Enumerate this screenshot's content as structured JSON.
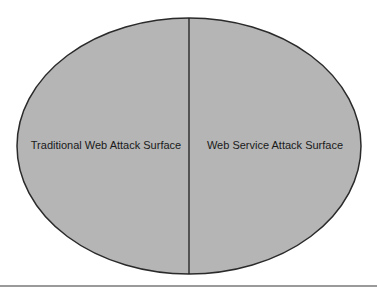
{
  "diagram": {
    "type": "split-ellipse",
    "colors": {
      "fill": "#b5b5b5",
      "stroke": "#2a2a2a",
      "divider": "#1e1e1e",
      "rule": "#9a9a9a"
    },
    "regions": [
      {
        "label": "Traditional Web Attack Surface"
      },
      {
        "label": "Web Service Attack Surface"
      }
    ]
  }
}
